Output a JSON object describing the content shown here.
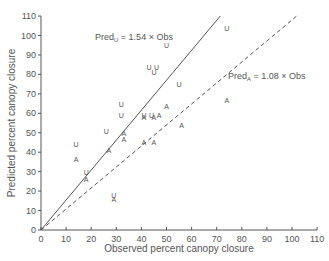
{
  "chart_data": {
    "type": "scatter",
    "title": "",
    "xlabel": "Observed percent canopy closure",
    "ylabel": "Predicted percent canopy closure",
    "xlim": [
      0,
      110
    ],
    "ylim": [
      0,
      110
    ],
    "x_ticks": [
      0,
      10,
      20,
      30,
      40,
      50,
      60,
      70,
      80,
      90,
      100,
      110
    ],
    "y_ticks": [
      0,
      10,
      20,
      30,
      40,
      50,
      60,
      70,
      80,
      90,
      100,
      110
    ],
    "grid": false,
    "series": [
      {
        "name": "U",
        "marker": "U",
        "points": [
          [
            14,
            44
          ],
          [
            18,
            30
          ],
          [
            29,
            18
          ],
          [
            26,
            51
          ],
          [
            32,
            65
          ],
          [
            32,
            59
          ],
          [
            43,
            84
          ],
          [
            46,
            84
          ],
          [
            45,
            81
          ],
          [
            50,
            95
          ],
          [
            55,
            75
          ],
          [
            41,
            59
          ],
          [
            44,
            59
          ],
          [
            74,
            104
          ]
        ]
      },
      {
        "name": "A",
        "marker": "A",
        "points": [
          [
            14,
            36.5
          ],
          [
            18,
            26
          ],
          [
            29,
            16
          ],
          [
            27,
            41
          ],
          [
            33,
            50
          ],
          [
            33,
            47
          ],
          [
            41,
            58
          ],
          [
            45,
            58
          ],
          [
            47,
            59
          ],
          [
            50,
            64
          ],
          [
            56,
            54
          ],
          [
            41,
            45
          ],
          [
            45,
            45
          ],
          [
            74,
            67
          ]
        ]
      }
    ],
    "lines": [
      {
        "name": "PredU",
        "slope": 1.54,
        "style": "solid",
        "label_main": "Pred",
        "label_sub": "U",
        "label_rest": " = 1.54 × Obs"
      },
      {
        "name": "PredA",
        "slope": 1.08,
        "style": "dashed",
        "label_main": "Pred",
        "label_sub": "A",
        "label_rest": " = 1.08 × Obs"
      }
    ]
  }
}
